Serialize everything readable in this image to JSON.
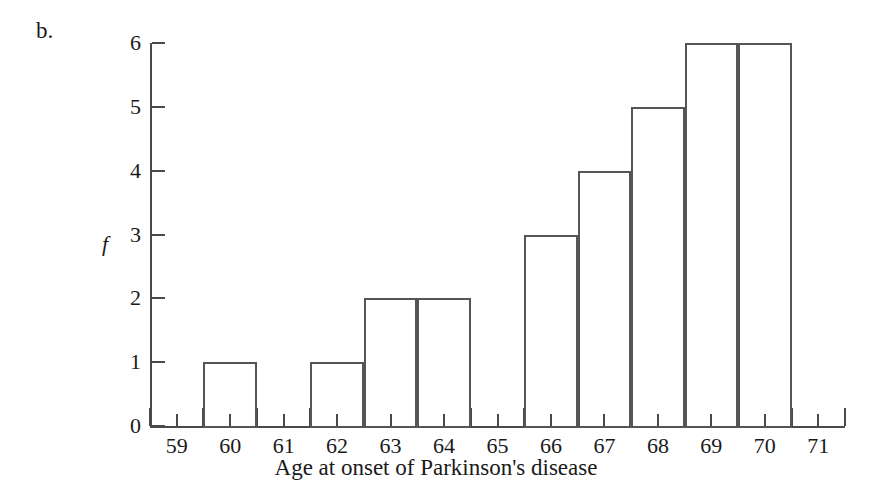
{
  "figure": {
    "part_label": "b."
  },
  "chart_data": {
    "type": "bar",
    "title": "",
    "xlabel": "Age at onset of Parkinson's disease",
    "ylabel": "f",
    "categories": [
      "59",
      "60",
      "61",
      "62",
      "63",
      "64",
      "65",
      "66",
      "67",
      "68",
      "69",
      "70",
      "71"
    ],
    "values": [
      0,
      1,
      0,
      1,
      2,
      2,
      0,
      3,
      4,
      5,
      6,
      6,
      0
    ],
    "xlim": [
      58.5,
      71.5
    ],
    "ylim": [
      0,
      6
    ],
    "y_ticks": [
      "0",
      "1",
      "2",
      "3",
      "4",
      "5",
      "6"
    ],
    "y_tick_values": [
      0,
      1,
      2,
      3,
      4,
      5,
      6
    ],
    "grid": false,
    "legend": false,
    "bar_fill": "#ffffff",
    "bar_stroke": "#555555",
    "axis_color": "#4a4a4a",
    "text_color": "#1a1a1a",
    "background": "#ffffff",
    "bin_width": 1,
    "bars_centered_on_ticks": true
  }
}
